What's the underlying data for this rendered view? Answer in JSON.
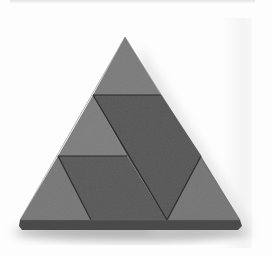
{
  "image": {
    "description": "Photograph of a wooden equilateral triangle puzzle composed of gray pieces on a white background",
    "background_color": "#fdfdfd",
    "pieces": [
      {
        "name": "top-triangle",
        "shade": "light",
        "color": "#7a7a7a"
      },
      {
        "name": "left-middle-triangle",
        "shade": "light",
        "color": "#7c7c7c"
      },
      {
        "name": "center-parallelogram",
        "shade": "dark",
        "color": "#555555"
      },
      {
        "name": "bottom-parallelogram",
        "shade": "dark",
        "color": "#575757"
      },
      {
        "name": "bottom-left-triangle",
        "shade": "light",
        "color": "#767676"
      },
      {
        "name": "bottom-right-triangle",
        "shade": "light",
        "color": "#747474"
      }
    ],
    "base_edge_color": "#4a4a4a",
    "seam_color": "#2a2a2a",
    "shadow_color": "#bdbdbd"
  }
}
